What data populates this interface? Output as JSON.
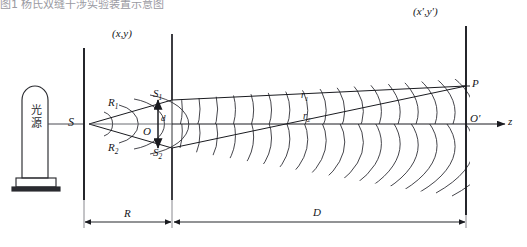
{
  "figure": {
    "kind": "young-double-slit-interference",
    "top_partial_text": "图1  杨氏双缝干涉实验装置示意图",
    "background": "#ffffff",
    "ink": "#1a1b20"
  },
  "source": {
    "lamp_label_line1": "光",
    "lamp_label_line2": "源",
    "lamp_name": "light-source-lamp"
  },
  "planes": {
    "pinhole_plane_label": "S",
    "slit_plane_label": "(x,y)",
    "screen_plane_label": "(x',y')"
  },
  "points": {
    "pinhole": "S",
    "slit_upper": "S",
    "slit_upper_sub": "1",
    "slit_lower": "S",
    "slit_lower_sub": "2",
    "slit_center": "O",
    "screen_point": "P",
    "screen_center": "O",
    "screen_center_prime": "O′"
  },
  "rays": {
    "upper_from_source": "R",
    "upper_from_source_sub": "1",
    "lower_from_source": "R",
    "lower_from_source_sub": "2",
    "upper_to_screen": "r",
    "upper_to_screen_sub": "1",
    "lower_to_screen": "r",
    "lower_to_screen_sub": "2"
  },
  "dimensions": {
    "slit_separation": "d",
    "source_to_slits": "R",
    "slits_to_screen": "D"
  },
  "axis": {
    "label": "z",
    "direction": "right"
  },
  "wavefronts": {
    "upper_source": "S1",
    "lower_source": "S2",
    "count_per_source": 17,
    "description": "expanding circular wavefront arcs from each slit"
  }
}
